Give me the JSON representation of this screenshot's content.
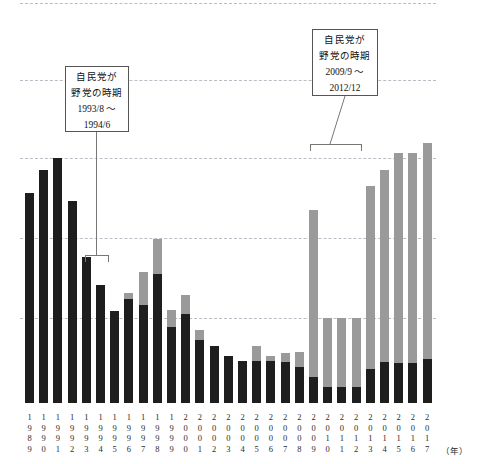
{
  "chart_data": {
    "type": "bar",
    "stacked": true,
    "title": "",
    "xlabel": "(年)",
    "ylabel": "",
    "grid": true,
    "legend_position": "none",
    "axis": {
      "gridline_count": 5,
      "baseline_y_px": 403
    },
    "colors": {
      "dark_series": "#1e1e1e",
      "gray_series": "#9a9a9a",
      "gridline": "#b9b9c4",
      "callout_border": "#555555"
    },
    "categories": [
      "1989",
      "1990",
      "1991",
      "1992",
      "1993",
      "1994",
      "1995",
      "1996",
      "1997",
      "1998",
      "1999",
      "2000",
      "2001",
      "2002",
      "2003",
      "2004",
      "2005",
      "2006",
      "2007",
      "2008",
      "2009",
      "2010",
      "2011",
      "2012",
      "2013",
      "2014",
      "2015",
      "2016",
      "2017"
    ],
    "series": [
      {
        "name": "dark",
        "values": [
          210,
          233,
          245,
          202,
          146,
          118,
          92,
          104,
          98,
          129,
          76,
          89,
          63,
          57,
          47,
          42,
          42,
          42,
          41,
          36,
          26,
          16,
          16,
          16,
          34,
          41,
          40,
          40,
          44
        ]
      },
      {
        "name": "gray",
        "values": [
          0,
          0,
          0,
          0,
          0,
          0,
          0,
          206,
          233,
          235,
          217,
          219,
          210,
          199,
          208,
          205,
          215,
          205,
          209,
          215,
          167,
          69,
          69,
          69,
          183,
          196,
          214,
          214,
          216
        ]
      }
    ],
    "bar_tops_px": [
      193,
      170,
      158,
      201,
      257,
      285,
      311,
      293,
      272,
      239,
      310,
      295,
      330,
      347,
      356,
      361,
      346,
      356,
      353,
      352,
      210,
      318,
      318,
      318,
      186,
      170,
      153,
      153,
      143
    ],
    "dark_tops_px": [
      193,
      170,
      158,
      201,
      257,
      285,
      311,
      299,
      305,
      274,
      327,
      314,
      340,
      346,
      356,
      361,
      361,
      361,
      362,
      367,
      377,
      387,
      387,
      387,
      369,
      362,
      363,
      363,
      359
    ],
    "geometry": {
      "first_bar_left_px": 25,
      "bar_width_px": 9,
      "bar_pitch_px": 14.2,
      "plot_top_px": 3,
      "plot_bottom_px": 403
    }
  },
  "annotations": [
    {
      "id": "ldp-opposition-1993",
      "line1": "自民党が",
      "line2": "野党の時期",
      "line3": "1993/8 ～",
      "line4": "1994/6",
      "box": {
        "left": 65,
        "top": 66,
        "width": 64,
        "height": 66
      },
      "leader": {
        "x": 96,
        "top": 132,
        "height": 123
      },
      "bracket": {
        "left": 85,
        "top": 255,
        "width": 24,
        "height": 7
      }
    },
    {
      "id": "ldp-opposition-2009",
      "line1": "自民党が",
      "line2": "野党の時期",
      "line3": "2009/9 ～",
      "line4": "2012/12",
      "box": {
        "left": 312,
        "top": 29,
        "width": 66,
        "height": 67
      },
      "leader": {
        "x1": 345,
        "y1": 96,
        "x2": 330,
        "y2": 144
      },
      "bracket": {
        "left": 310,
        "top": 144,
        "width": 52,
        "height": 7
      }
    }
  ],
  "x_axis": {
    "unit_label": "（年）",
    "years": [
      "1989",
      "1990",
      "1991",
      "1992",
      "1993",
      "1994",
      "1995",
      "1996",
      "1997",
      "1998",
      "1999",
      "2000",
      "2001",
      "2002",
      "2003",
      "2004",
      "2005",
      "2006",
      "2007",
      "2008",
      "2009",
      "2010",
      "2011",
      "2012",
      "2013",
      "2014",
      "2015",
      "2016",
      "2017"
    ]
  }
}
